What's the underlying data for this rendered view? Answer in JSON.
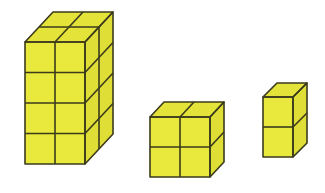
{
  "figure": {
    "face_color": "#e9e83c",
    "edge_color": "#3b3a1c",
    "prisms": [
      {
        "name": "tall-prism",
        "front_cols": 2,
        "rows": 4,
        "depth": 2,
        "unit_cubes": 16
      },
      {
        "name": "medium-cube",
        "front_cols": 2,
        "rows": 2,
        "depth": 2,
        "unit_cubes": 8
      },
      {
        "name": "small-prism",
        "front_cols": 1,
        "rows": 2,
        "depth": 1,
        "unit_cubes": 2
      }
    ]
  }
}
